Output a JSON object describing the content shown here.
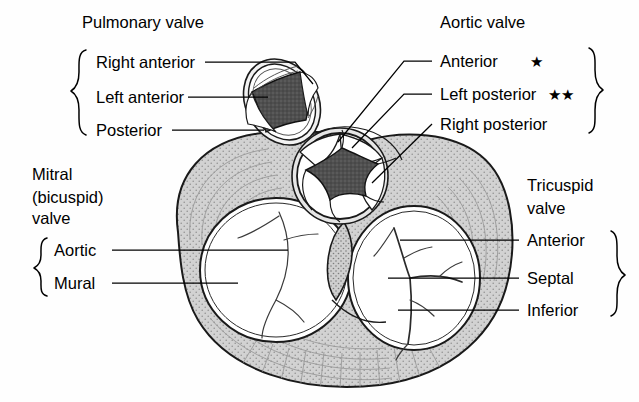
{
  "figure": {
    "background_color": "#fefefe"
  },
  "colors": {
    "myocardium_fill": "#d2d2d2",
    "stipple": "#8d8d8d",
    "lumen_dark": "#4a4a4a",
    "cusp_white": "#ffffff",
    "outline": "#1a1a1a",
    "text": "#000000"
  },
  "labels": {
    "pulmonary": {
      "heading": "Pulmonary valve",
      "cusps": [
        {
          "text": "Right anterior"
        },
        {
          "text": "Left anterior"
        },
        {
          "text": "Posterior"
        }
      ]
    },
    "aortic": {
      "heading": "Aortic valve",
      "cusps": [
        {
          "text": "Anterior",
          "marker": "★"
        },
        {
          "text": "Left posterior",
          "marker": "★★"
        },
        {
          "text": "Right posterior",
          "marker": ""
        }
      ]
    },
    "mitral": {
      "heading_line1": "Mitral",
      "heading_line2": "(bicuspid)",
      "heading_line3": "valve",
      "cusps": [
        {
          "text": "Aortic"
        },
        {
          "text": "Mural"
        }
      ]
    },
    "tricuspid": {
      "heading_line1": "Tricuspid",
      "heading_line2": "valve",
      "cusps": [
        {
          "text": "Anterior"
        },
        {
          "text": "Septal"
        },
        {
          "text": "Inferior"
        }
      ]
    }
  }
}
